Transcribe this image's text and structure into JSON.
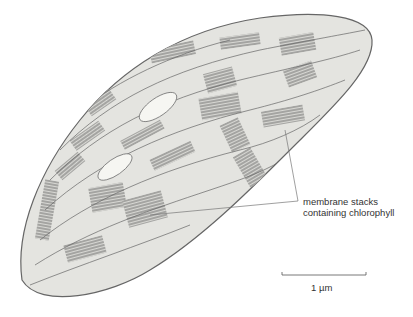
{
  "figure": {
    "annotation": {
      "line1": "membrane stacks",
      "line2": "containing chlorophyll"
    },
    "scale_bar": {
      "label": "1 µm"
    }
  }
}
